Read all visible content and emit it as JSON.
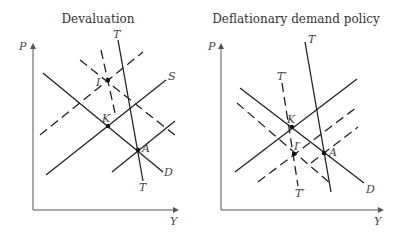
{
  "panels": [
    {
      "id": "devaluation",
      "title": "Devaluation",
      "axes": {
        "y_label": "P",
        "x_label": "Y"
      },
      "curves": [
        {
          "name": "D",
          "style": "solid",
          "label": "D"
        },
        {
          "name": "S",
          "style": "solid",
          "label": "S"
        },
        {
          "name": "T",
          "style": "solid",
          "label_top": "T",
          "label_bottom": "T"
        },
        {
          "name": "S-shifted",
          "style": "dashed"
        },
        {
          "name": "D-shifted",
          "style": "dashed"
        },
        {
          "name": "T-shifted",
          "style": "dashed"
        },
        {
          "name": "S-lower",
          "style": "solid"
        }
      ],
      "points": [
        {
          "name": "I",
          "label": "I"
        },
        {
          "name": "K",
          "label": "K"
        },
        {
          "name": "A",
          "label": "A"
        }
      ]
    },
    {
      "id": "deflationary-demand-policy",
      "title": "Deflationary demand policy",
      "axes": {
        "y_label": "P",
        "x_label": "Y"
      },
      "curves": [
        {
          "name": "D",
          "style": "solid",
          "label": "D"
        },
        {
          "name": "S",
          "style": "solid"
        },
        {
          "name": "T",
          "style": "solid",
          "label": "T"
        },
        {
          "name": "T-prime",
          "style": "dashed",
          "label_top": "T′",
          "label_bottom": "T′"
        },
        {
          "name": "D-shifted",
          "style": "dashed"
        },
        {
          "name": "S-shifted-1",
          "style": "dashed"
        },
        {
          "name": "S-shifted-2",
          "style": "dashed"
        }
      ],
      "points": [
        {
          "name": "K",
          "label": "K"
        },
        {
          "name": "I-prime",
          "label": "I′"
        },
        {
          "name": "A",
          "label": "A"
        }
      ]
    }
  ],
  "colors": {
    "line": "#222222",
    "axis": "#555555",
    "text": "#333333"
  }
}
